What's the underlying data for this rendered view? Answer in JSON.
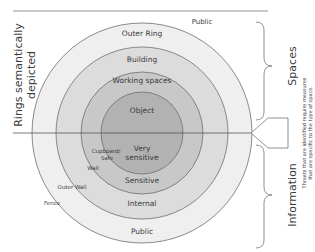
{
  "diagram": {
    "left_label_line1": "Rings semantically",
    "left_label_line2": "depicted",
    "rings_spaces": {
      "outside": "Public",
      "outer_ring": "Outer Ring",
      "building": "Building",
      "working_spaces": "Working spaces",
      "object": "Object"
    },
    "rings_information": {
      "very_sensitive_line1": "Very",
      "very_sensitive_line2": "sensitive",
      "sensitive": "Sensitive",
      "internal": "Internal",
      "public": "Public"
    },
    "barriers": {
      "cupboard_line1": "Cupboard/",
      "cupboard_line2": "Safe",
      "wall": "Wall",
      "outer_wall": "Outer Wall",
      "fence": "Fence"
    },
    "braces": {
      "spaces": "Spaces",
      "information": "Information"
    },
    "callout": {
      "line1": "Threats that are identified require measures",
      "line2": "that are specific to the type of space."
    },
    "colors": {
      "ring_outer": "#efefef",
      "ring_building": "#dcdcdc",
      "ring_working": "#c8c8c8",
      "ring_object": "#b2b2b2",
      "stroke": "#6e6e6e"
    }
  }
}
